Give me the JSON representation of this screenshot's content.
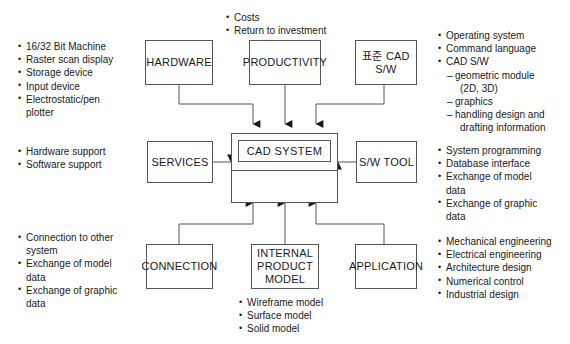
{
  "diagram": {
    "stroke_color": "#555555",
    "text_color": "#1a1a1a",
    "background": "#ffffff"
  },
  "hub": {
    "label": "CAD SYSTEM"
  },
  "nodes": {
    "hardware": "HARDWARE",
    "productivity": "PRODUCTIVITY",
    "standard_cad_sw": "표준 CAD\nS/W",
    "services": "SERVICES",
    "sw_tool": "S/W TOOL",
    "connection": "CONNECTION",
    "internal_product_model": "INTERNAL\nPRODUCT\nMODEL",
    "application": "APPLICATION"
  },
  "notes": {
    "hardware": [
      {
        "level": 1,
        "text": "16/32 Bit Machine"
      },
      {
        "level": 1,
        "text": "Raster scan display"
      },
      {
        "level": 1,
        "text": "Storage device"
      },
      {
        "level": 1,
        "text": "Input device"
      },
      {
        "level": 1,
        "text": "Electrostatic/pen"
      },
      {
        "level": 0,
        "text": "plotter"
      }
    ],
    "services": [
      {
        "level": 1,
        "text": "Hardware support"
      },
      {
        "level": 1,
        "text": "Software support"
      }
    ],
    "connection": [
      {
        "level": 1,
        "text": "Connection to other"
      },
      {
        "level": 0,
        "text": "system"
      },
      {
        "level": 1,
        "text": "Exchange of model"
      },
      {
        "level": 0,
        "text": "data"
      },
      {
        "level": 1,
        "text": "Exchange of graphic"
      },
      {
        "level": 0,
        "text": "data"
      }
    ],
    "productivity": [
      {
        "level": 1,
        "text": "Costs"
      },
      {
        "level": 1,
        "text": "Return to investment"
      }
    ],
    "internal_product_model": [
      {
        "level": 1,
        "text": "Wireframe model"
      },
      {
        "level": 1,
        "text": "Surface model"
      },
      {
        "level": 1,
        "text": "Solid model"
      }
    ],
    "standard_cad_sw": [
      {
        "level": 1,
        "text": "Operating system"
      },
      {
        "level": 1,
        "text": "Command language"
      },
      {
        "level": 1,
        "text": "CAD S/W"
      },
      {
        "level": 2,
        "text": "geometric module"
      },
      {
        "level": 3,
        "text": "(2D, 3D)"
      },
      {
        "level": 2,
        "text": "graphics"
      },
      {
        "level": 2,
        "text": "handling design and"
      },
      {
        "level": 3,
        "text": "drafting information"
      }
    ],
    "sw_tool": [
      {
        "level": 1,
        "text": "System programming"
      },
      {
        "level": 1,
        "text": "Database interface"
      },
      {
        "level": 1,
        "text": "Exchange of model"
      },
      {
        "level": 0,
        "text": "data"
      },
      {
        "level": 1,
        "text": "Exchange of graphic"
      },
      {
        "level": 0,
        "text": "data"
      }
    ],
    "application": [
      {
        "level": 1,
        "text": "Mechanical engineering"
      },
      {
        "level": 1,
        "text": "Electrical engineering"
      },
      {
        "level": 1,
        "text": "Architecture design"
      },
      {
        "level": 1,
        "text": "Numerical control"
      },
      {
        "level": 1,
        "text": "Industrial design"
      }
    ]
  }
}
